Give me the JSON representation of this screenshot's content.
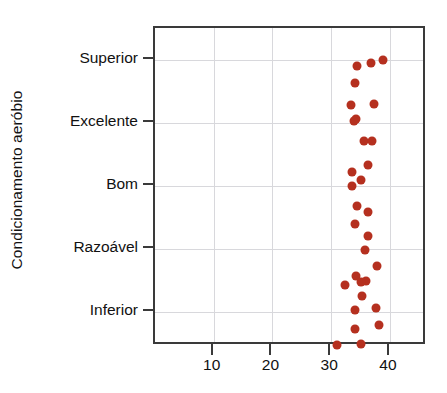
{
  "chart_data": {
    "type": "scatter",
    "title": "",
    "xlabel": "",
    "ylabel": "Condicionamento aeróbio",
    "xlim": [
      0,
      46.3
    ],
    "xticks": [
      10,
      20,
      30,
      40
    ],
    "xticklabels": [
      "10",
      "20",
      "30",
      "40"
    ],
    "yticks": [
      1,
      2,
      3,
      4,
      5
    ],
    "yticklabels": [
      "Inferior",
      "Razoável",
      "Bom",
      "Excelente",
      "Superior"
    ],
    "ylim": [
      0.46,
      5.51
    ],
    "grid": "both",
    "legend": "none",
    "marker_color": "#b5301f",
    "points": [
      {
        "x": 38.8,
        "y": 5.0
      },
      {
        "x": 36.8,
        "y": 4.95
      },
      {
        "x": 34.3,
        "y": 4.9
      },
      {
        "x": 34.1,
        "y": 4.64
      },
      {
        "x": 33.3,
        "y": 4.28
      },
      {
        "x": 37.3,
        "y": 4.31
      },
      {
        "x": 34.2,
        "y": 4.06
      },
      {
        "x": 33.9,
        "y": 4.03
      },
      {
        "x": 35.5,
        "y": 3.71
      },
      {
        "x": 37.0,
        "y": 3.72
      },
      {
        "x": 36.3,
        "y": 3.34
      },
      {
        "x": 33.6,
        "y": 3.23
      },
      {
        "x": 35.0,
        "y": 3.09
      },
      {
        "x": 33.5,
        "y": 3.0
      },
      {
        "x": 34.3,
        "y": 2.69
      },
      {
        "x": 36.2,
        "y": 2.59
      },
      {
        "x": 34.0,
        "y": 2.4
      },
      {
        "x": 36.2,
        "y": 2.21
      },
      {
        "x": 35.7,
        "y": 1.99
      },
      {
        "x": 37.8,
        "y": 1.73
      },
      {
        "x": 34.2,
        "y": 1.57
      },
      {
        "x": 36.0,
        "y": 1.49
      },
      {
        "x": 32.3,
        "y": 1.43
      },
      {
        "x": 35.2,
        "y": 1.25
      },
      {
        "x": 37.7,
        "y": 1.06
      },
      {
        "x": 34.0,
        "y": 1.03
      },
      {
        "x": 35.0,
        "y": 1.47
      },
      {
        "x": 38.2,
        "y": 0.79
      },
      {
        "x": 34.1,
        "y": 0.73
      },
      {
        "x": 31.0,
        "y": 0.47
      },
      {
        "x": 35.0,
        "y": 0.49
      }
    ]
  },
  "axis": {
    "y_title": "Condicionamento aeróbio",
    "y_labels": [
      "Superior",
      "Excelente",
      "Bom",
      "Razoável",
      "Inferior"
    ],
    "x_labels": [
      "10",
      "20",
      "30",
      "40"
    ]
  }
}
